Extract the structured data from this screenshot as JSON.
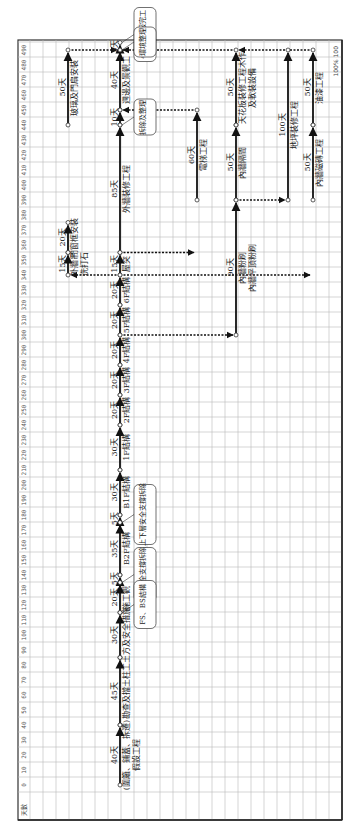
{
  "diagram": {
    "type": "construction-schedule-network",
    "orientation": "rotated-90-ccw",
    "axis": {
      "header_label": "天數",
      "ticks": [
        0,
        10,
        20,
        30,
        40,
        50,
        60,
        70,
        80,
        90,
        100,
        110,
        120,
        130,
        140,
        150,
        160,
        170,
        180,
        190,
        200,
        210,
        220,
        230,
        240,
        250,
        260,
        270,
        280,
        290,
        300,
        310,
        320,
        330,
        340,
        350,
        360,
        370,
        380,
        390,
        400,
        410,
        420,
        430,
        440,
        450,
        460,
        470,
        480,
        490
      ],
      "end_label": "100%",
      "end_value": "100"
    },
    "tasks": [
      {
        "id": "t1",
        "lane": 120,
        "start": 0,
        "end": 40,
        "duration": "40天",
        "label": "(圍籬、鋪蓋、拆遷)",
        "sub": "假設工程"
      },
      {
        "id": "t2",
        "lane": 120,
        "start": 40,
        "end": 85,
        "duration": "45天",
        "label": "勘查及擋土柱工"
      },
      {
        "id": "t3",
        "lane": 120,
        "start": 85,
        "end": 115,
        "duration": "30天",
        "label": "土方及安全措施"
      },
      {
        "id": "t4",
        "lane": 120,
        "start": 115,
        "end": 135,
        "duration": "20天",
        "label": "施工觀"
      },
      {
        "id": "t5",
        "lane": 120,
        "start": 135,
        "end": 140,
        "duration": "5天",
        "label": ""
      },
      {
        "id": "t6",
        "lane": 120,
        "start": 140,
        "end": 175,
        "duration": "35天",
        "label": "B2F結構"
      },
      {
        "id": "t7",
        "lane": 120,
        "start": 175,
        "end": 180,
        "duration": "5天",
        "label": ""
      },
      {
        "id": "t8",
        "lane": 120,
        "start": 180,
        "end": 210,
        "duration": "30天",
        "label": "B1F結構"
      },
      {
        "id": "t9",
        "lane": 120,
        "start": 210,
        "end": 240,
        "duration": "30天",
        "label": "1F結構"
      },
      {
        "id": "t10",
        "lane": 120,
        "start": 240,
        "end": 260,
        "duration": "20天",
        "label": "2F結構"
      },
      {
        "id": "t11",
        "lane": 120,
        "start": 260,
        "end": 280,
        "duration": "20天",
        "label": "3F結構"
      },
      {
        "id": "t12",
        "lane": 120,
        "start": 280,
        "end": 300,
        "duration": "20天",
        "label": "4F結構"
      },
      {
        "id": "t13",
        "lane": 120,
        "start": 300,
        "end": 320,
        "duration": "20天",
        "label": "5F結構"
      },
      {
        "id": "t14",
        "lane": 120,
        "start": 320,
        "end": 340,
        "duration": "20天",
        "label": "6F結構"
      },
      {
        "id": "t15",
        "lane": 120,
        "start": 340,
        "end": 355,
        "duration": "15天",
        "label": "屋突"
      },
      {
        "id": "t16",
        "lane": 120,
        "start": 355,
        "end": 440,
        "duration": "85天",
        "label": "外牆裝修工程"
      },
      {
        "id": "t17",
        "lane": 120,
        "start": 440,
        "end": 450,
        "duration": "10天",
        "label": ""
      },
      {
        "id": "t18",
        "lane": 120,
        "start": 450,
        "end": 490,
        "duration": "40天",
        "label": "週邊及景觀工"
      },
      {
        "id": "t19",
        "lane": 120,
        "start": 490,
        "end": 495,
        "duration": "5天",
        "label": ""
      },
      {
        "id": "t20",
        "lane": 68,
        "start": 340,
        "end": 355,
        "duration": "15天",
        "label": "外牆吊",
        "sub": "洗打石"
      },
      {
        "id": "t21",
        "lane": 68,
        "start": 355,
        "end": 375,
        "duration": "20天",
        "label": "門窗框安裝"
      },
      {
        "id": "t22",
        "lane": 68,
        "start": 440,
        "end": 490,
        "duration": "50天",
        "label": "玻璃及門扇安裝"
      },
      {
        "id": "t23",
        "lane": 197,
        "start": 390,
        "end": 450,
        "duration": "60天",
        "label": "電梯工程"
      },
      {
        "id": "t24",
        "lane": 236,
        "start": 300,
        "end": 390,
        "duration": "90天",
        "label": "內牆粉刷",
        "sub": "內牆平頂粉刷"
      },
      {
        "id": "t25",
        "lane": 236,
        "start": 390,
        "end": 440,
        "duration": "50天",
        "label": "內牆隔間"
      },
      {
        "id": "t26",
        "lane": 236,
        "start": 440,
        "end": 490,
        "duration": "50天",
        "label": "天花板裝修工程木作",
        "sub": "及軟裝設備"
      },
      {
        "id": "t27",
        "lane": 288,
        "start": 390,
        "end": 490,
        "duration": "100天",
        "label": "地坪裝修工程"
      },
      {
        "id": "t28",
        "lane": 313,
        "start": 390,
        "end": 440,
        "duration": "50天",
        "label": "內牆磁磚工程"
      },
      {
        "id": "t29",
        "lane": 313,
        "start": 440,
        "end": 490,
        "duration": "50天",
        "label": "油漆工程"
      }
    ],
    "dependencies": [
      {
        "from_lane": 68,
        "to_lane": 120,
        "day": 490,
        "label": "dummy"
      },
      {
        "from_lane": 120,
        "to_lane": 197,
        "day": 355
      },
      {
        "from_lane": 197,
        "to_lane": 120,
        "day": 450
      },
      {
        "from_lane": 120,
        "to_lane": 236,
        "day": 300
      },
      {
        "from_lane": 236,
        "to_lane": 288,
        "day": 390
      },
      {
        "from_lane": 120,
        "to_lane": 313,
        "day": 340
      },
      {
        "from_lane": 120,
        "to_lane": 68,
        "day": 340
      },
      {
        "from_lane": 236,
        "to_lane": 120,
        "day": 490
      },
      {
        "from_lane": 313,
        "to_lane": 236,
        "day": 490
      }
    ],
    "callouts": [
      {
        "day": 495,
        "lane": 120,
        "text": "495天申報完工"
      },
      {
        "day": 490,
        "lane": 120,
        "text": "環境整理"
      },
      {
        "day": 440,
        "lane": 120,
        "text": "拆除及整理"
      },
      {
        "day": 175,
        "lane": 120,
        "text": "上下層安全支撐拆除"
      },
      {
        "day": 135,
        "lane": 120,
        "text": "下層安全支撐拆除"
      },
      {
        "day": 115,
        "lane": 120,
        "text": "FS、BS結構"
      }
    ]
  }
}
